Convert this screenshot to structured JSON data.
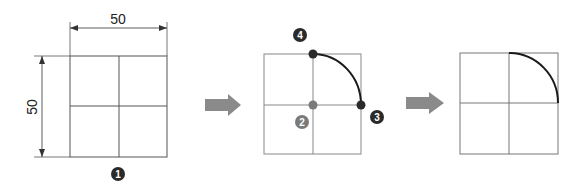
{
  "diagram": {
    "colors": {
      "grid_line": "#555555",
      "grid_line_light": "#888888",
      "arc": "#1a1a1a",
      "badge_dark": "#2a2a2a",
      "badge_gray": "#7a7a7a",
      "arrow": "#8a8a8a",
      "dimension": "#333333"
    },
    "step1": {
      "dimension_width": "50",
      "dimension_height": "50",
      "badge": "1"
    },
    "step2": {
      "badge_center": "2",
      "badge_end": "3",
      "badge_start": "4"
    },
    "step3": {
      "description": "Resulting quarter arc"
    },
    "arrows": [
      "arrow-right",
      "arrow-right"
    ]
  }
}
